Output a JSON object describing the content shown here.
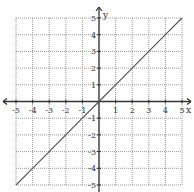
{
  "chart_data": {
    "type": "line",
    "title": "",
    "xlabel": "x",
    "ylabel": "y",
    "xlim": [
      -5,
      5
    ],
    "ylim": [
      -5,
      5
    ],
    "grid": true,
    "x_ticks": [
      -5,
      -4,
      -3,
      -2,
      -1,
      1,
      2,
      3,
      4,
      5
    ],
    "y_ticks": [
      -5,
      -4,
      -3,
      -2,
      -1,
      1,
      2,
      3,
      4,
      5
    ],
    "x_tick_labels": [
      "-5",
      "-4",
      "-3",
      "-2",
      "-1",
      "1",
      "2",
      "3",
      "4",
      "5"
    ],
    "y_tick_labels": [
      "-5",
      "-4",
      "-3",
      "-2",
      "-1",
      "1",
      "2",
      "3",
      "4",
      "5"
    ],
    "series": [
      {
        "name": "y = x",
        "x": [
          -5,
          -4,
          -3,
          -2,
          -1,
          0,
          1,
          2,
          3,
          4,
          5
        ],
        "y": [
          -5,
          -4,
          -3,
          -2,
          -1,
          0,
          1,
          2,
          3,
          4,
          5
        ]
      }
    ],
    "legend": null
  },
  "colors": {
    "grid": "#9a9a9a",
    "axis": "#333333",
    "line": "#555555",
    "background": "#ffffff"
  }
}
